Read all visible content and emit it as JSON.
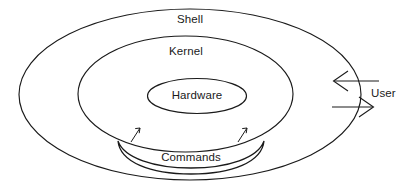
{
  "diagram": {
    "type": "concentric-ellipse-layers",
    "background_color": "#ffffff",
    "stroke_color": "#1a1a1a",
    "layers": [
      {
        "id": "shell",
        "label": "Shell",
        "level": 1,
        "shape": "ellipse",
        "description": "Outermost layer surrounding the kernel"
      },
      {
        "id": "kernel",
        "label": "Kernel",
        "level": 2,
        "shape": "ellipse",
        "description": "Middle layer surrounding the hardware"
      },
      {
        "id": "hardware",
        "label": "Hardware",
        "level": 3,
        "shape": "ellipse",
        "description": "Innermost core layer"
      }
    ],
    "band": {
      "id": "commands",
      "label": "Commands",
      "shape": "crescent-band",
      "description": "Curved band beneath the kernel with two arrows pointing into the kernel"
    },
    "actor": {
      "id": "user",
      "label": "User",
      "description": "External actor exchanging input and output across the shell boundary"
    },
    "arrows": [
      {
        "id": "user-input-arrow",
        "direction": "left",
        "from": "user",
        "to": "shell",
        "label": ""
      },
      {
        "id": "user-output-arrow",
        "direction": "right",
        "from": "shell",
        "to": "user",
        "label": ""
      },
      {
        "id": "commands-to-kernel-left",
        "direction": "up-right",
        "from": "commands",
        "to": "kernel",
        "label": ""
      },
      {
        "id": "commands-to-kernel-right",
        "direction": "up-right",
        "from": "commands",
        "to": "kernel",
        "label": ""
      }
    ]
  }
}
